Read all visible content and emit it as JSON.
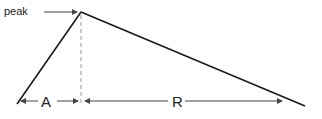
{
  "diagram": {
    "labels": {
      "peak": "peak",
      "rise": "A",
      "decay": "R"
    },
    "colors": {
      "line": "#1a1a1a",
      "dashed": "#999999",
      "arrow": "#444444"
    }
  }
}
